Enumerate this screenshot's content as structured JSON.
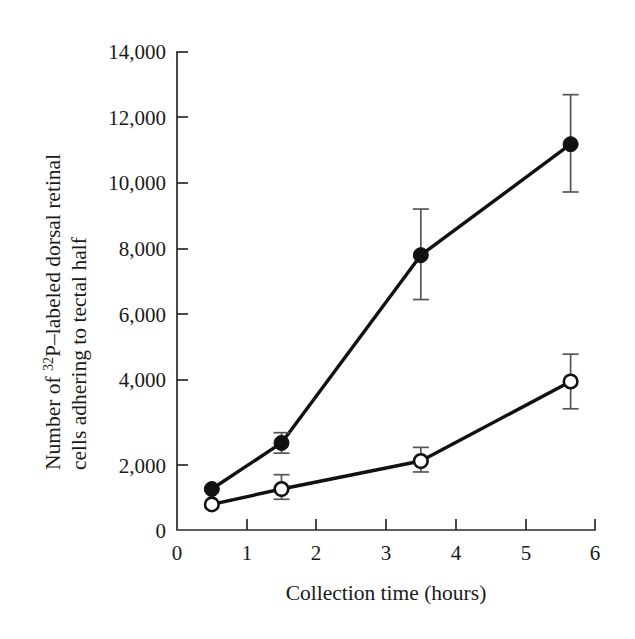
{
  "chart_data": {
    "type": "line",
    "title": "",
    "xlabel": "Collection time (hours)",
    "ylabel_line1_pre": "Number of ",
    "ylabel_line1_sup": "32",
    "ylabel_line1_post": "P–labeled dorsal retinal",
    "ylabel_line2": "cells adhering to tectal half",
    "ylabel_full": "Number of 32P–labeled dorsal retinal cells adhering to tectal half",
    "xlim": [
      0,
      6
    ],
    "ylim": [
      0,
      14000
    ],
    "x_ticks": [
      0,
      1,
      2,
      3,
      4,
      5,
      6
    ],
    "x_tick_labels": [
      "0",
      "1",
      "2",
      "3",
      "4",
      "5",
      "6"
    ],
    "y_ticks": [
      0,
      2000,
      4000,
      6000,
      8000,
      10000,
      12000,
      14000
    ],
    "y_tick_labels": [
      "0",
      "2,000",
      "4,000",
      "6,000",
      "8,000",
      "10,000",
      "12,000",
      "14,000"
    ],
    "grid": false,
    "legend": "none",
    "series": [
      {
        "name": "filled-circles",
        "marker": "filled-circle",
        "color": "#111111",
        "x": [
          0.5,
          1.5,
          3.5,
          5.65
        ],
        "values": [
          1200,
          2550,
          8050,
          11300
        ],
        "err_low": [
          0,
          2250,
          6750,
          9900
        ],
        "err_high": [
          0,
          2850,
          9400,
          12750
        ],
        "has_error_bars": [
          false,
          true,
          true,
          true
        ]
      },
      {
        "name": "open-circles",
        "marker": "open-circle",
        "color": "#111111",
        "x": [
          0.5,
          1.5,
          3.5,
          5.65
        ],
        "values": [
          750,
          1200,
          2020,
          4350
        ],
        "err_low": [
          0,
          900,
          1700,
          3550
        ],
        "err_high": [
          0,
          1620,
          2420,
          5150
        ],
        "has_error_bars": [
          false,
          true,
          true,
          true
        ]
      }
    ]
  }
}
